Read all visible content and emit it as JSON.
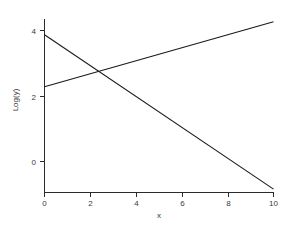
{
  "chart_data": {
    "type": "line",
    "title": "",
    "subtitle": "",
    "xlabel": "x",
    "ylabel": "Log(y)",
    "xlim": [
      0,
      10
    ],
    "ylim": [
      -1.1,
      4.55
    ],
    "xticks": [
      0,
      2,
      4,
      6,
      8,
      10
    ],
    "xtick_labels": [
      "0",
      "2",
      "4",
      "6",
      "8",
      "10"
    ],
    "yticks": [
      0,
      2,
      4
    ],
    "ytick_labels": [
      "0",
      "2",
      "4"
    ],
    "grid": false,
    "legend": null,
    "annotations": [],
    "series": [
      {
        "name": "descending",
        "x": [
          0,
          10
        ],
        "values": [
          3.9,
          -0.85
        ],
        "slope": -0.475,
        "intercept": 3.9,
        "color": "#1a1a1a"
      },
      {
        "name": "ascending",
        "x": [
          0,
          10
        ],
        "values": [
          2.3,
          4.3
        ],
        "slope": 0.2,
        "intercept": 2.3,
        "color": "#1a1a1a"
      }
    ],
    "intersection": {
      "x": 2.4,
      "y": 2.78
    }
  },
  "figure": {
    "background_color": "#ffffff",
    "axis_color": "#2b2b2b",
    "text_color": "#3a3a3a"
  }
}
